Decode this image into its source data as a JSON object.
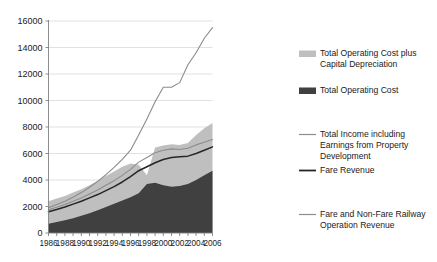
{
  "chart_data": {
    "type": "area",
    "title": "",
    "subtitle": "",
    "xlabel": "",
    "ylabel": "",
    "xlim": [
      1986,
      2006
    ],
    "ylim": [
      0,
      16000
    ],
    "yticks": [
      0,
      2000,
      4000,
      6000,
      8000,
      10000,
      12000,
      14000,
      16000
    ],
    "ytick_labels": [
      "0",
      "2000",
      "4000",
      "6000",
      "8000",
      "10000",
      "12000",
      "14000",
      "16000"
    ],
    "xticks": [
      1986,
      1987,
      1988,
      1989,
      1990,
      1991,
      1992,
      1993,
      1994,
      1995,
      1996,
      1997,
      1998,
      1999,
      2000,
      2001,
      2002,
      2003,
      2004,
      2005,
      2006
    ],
    "xtick_labels_shown": [
      "1986",
      "1988",
      "1990",
      "1992",
      "1994",
      "1996",
      "1998",
      "2000",
      "2002",
      "2004",
      "2006"
    ],
    "x": [
      1986,
      1987,
      1988,
      1989,
      1990,
      1991,
      1992,
      1993,
      1994,
      1995,
      1996,
      1997,
      1998,
      1999,
      2000,
      2001,
      2002,
      2003,
      2004,
      2005,
      2006
    ],
    "grid": true,
    "grid_axis": "y",
    "legend_position": "right",
    "series": [
      {
        "name": "Total Operating Cost plus Capital Depreciation",
        "kind": "area",
        "color": "#bfbfbf",
        "values": [
          2400,
          2600,
          2800,
          3050,
          3300,
          3600,
          3950,
          4300,
          4650,
          5000,
          5250,
          5150,
          4350,
          6450,
          6600,
          6700,
          6650,
          6800,
          7400,
          7900,
          8300
        ]
      },
      {
        "name": "Total Operating Cost",
        "kind": "area",
        "color": "#404040",
        "values": [
          700,
          830,
          960,
          1120,
          1300,
          1500,
          1720,
          1960,
          2200,
          2450,
          2700,
          3000,
          3700,
          3800,
          3600,
          3500,
          3550,
          3700,
          4000,
          4350,
          4700
        ]
      },
      {
        "name": "Total Income including Earnings from Property Development",
        "kind": "line",
        "color": "#8c8c8c",
        "values": [
          1900,
          2150,
          2400,
          2700,
          3050,
          3450,
          3900,
          4400,
          4950,
          5550,
          6250,
          7400,
          8600,
          9900,
          11000,
          11000,
          11350,
          12700,
          13600,
          14700,
          15500
        ]
      },
      {
        "name": "Fare Revenue",
        "kind": "line",
        "color": "#262626",
        "values": [
          1600,
          1780,
          1960,
          2180,
          2400,
          2650,
          2900,
          3200,
          3500,
          3850,
          4250,
          4700,
          5000,
          5300,
          5550,
          5700,
          5750,
          5800,
          6000,
          6250,
          6500
        ]
      },
      {
        "name": "Fare and Non-Fare Railway Operation Revenue",
        "kind": "line",
        "color": "#8c8c8c",
        "values": [
          1750,
          1950,
          2150,
          2400,
          2650,
          2950,
          3250,
          3600,
          3950,
          4350,
          4800,
          5350,
          5700,
          6050,
          6250,
          6350,
          6300,
          6400,
          6650,
          6850,
          7050
        ]
      }
    ],
    "legend_entries": [
      {
        "label": "Total Operating Cost plus Capital Depreciation",
        "marker": "swatch",
        "color": "#bfbfbf"
      },
      {
        "label": "Total Operating Cost",
        "marker": "swatch",
        "color": "#404040"
      },
      {
        "label": "Total Income including Earnings from Property Development",
        "marker": "line",
        "color": "#8c8c8c"
      },
      {
        "label": "Fare Revenue",
        "marker": "line",
        "color": "#262626"
      },
      {
        "label": "Fare and Non-Fare Railway Operation Revenue",
        "marker": "line",
        "color": "#8c8c8c"
      }
    ]
  },
  "colors": {
    "background": "#ffffff",
    "axis": "#808080",
    "grid": "#d9d9d9",
    "text": "#1a1a1a",
    "light_area": "#bfbfbf",
    "dark_area": "#404040",
    "line_gray": "#8c8c8c",
    "line_dark": "#262626"
  }
}
